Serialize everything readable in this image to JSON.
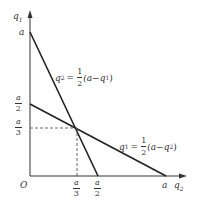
{
  "diagram": {
    "type": "reaction-function-graph",
    "axes": {
      "y_label": {
        "var": "q",
        "sub": "1"
      },
      "x_label": {
        "var": "q",
        "sub": "2"
      },
      "origin_label": "O"
    },
    "y_ticks": [
      {
        "label": "a",
        "kind": "plain"
      },
      {
        "num": "a",
        "den": "2",
        "kind": "frac"
      },
      {
        "num": "a",
        "den": "3",
        "kind": "frac"
      }
    ],
    "x_ticks": [
      {
        "num": "a",
        "den": "3",
        "kind": "frac"
      },
      {
        "num": "a",
        "den": "2",
        "kind": "frac"
      },
      {
        "label": "a",
        "kind": "plain"
      }
    ],
    "lines": [
      {
        "name": "reaction-q2",
        "lhs_var": "q",
        "lhs_sub": "2",
        "eq": "=",
        "coef_num": "1",
        "coef_den": "2",
        "rhs_open": "(a−",
        "rhs_var": "q",
        "rhs_sub": "1",
        "rhs_close": ")",
        "from": "(0, a)",
        "to": "(a/2, 0)"
      },
      {
        "name": "reaction-q1",
        "lhs_var": "q",
        "lhs_sub": "1",
        "eq": "=",
        "coef_num": "1",
        "coef_den": "2",
        "rhs_open": "(a−",
        "rhs_var": "q",
        "rhs_sub": "2",
        "rhs_close": ")",
        "from": "(0, a/2)",
        "to": "(a, 0)"
      }
    ],
    "intersection": "(a/3, a/3)",
    "colors": {
      "axis": "#333333",
      "line": "#222222",
      "dash": "#555555"
    }
  }
}
